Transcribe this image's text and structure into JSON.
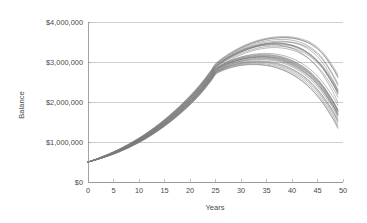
{
  "chart_data": {
    "type": "line",
    "title": "",
    "xlabel": "Years",
    "ylabel": "Balance",
    "xlim": [
      0,
      50
    ],
    "ylim": [
      0,
      4000000
    ],
    "grid": true,
    "legend": "none",
    "x_ticks": [
      0,
      5,
      10,
      15,
      20,
      25,
      30,
      35,
      40,
      45,
      50
    ],
    "x_tick_labels": [
      "0",
      "5",
      "10",
      "15",
      "20",
      "25",
      "30",
      "35",
      "40",
      "45",
      "50"
    ],
    "y_ticks": [
      0,
      1000000,
      2000000,
      3000000,
      4000000
    ],
    "y_tick_labels": [
      "$0",
      "$1,000,000",
      "$2,000,000",
      "$3,000,000",
      "$4,000,000"
    ],
    "line_color": "#7b7b7b",
    "grid_color": "#b9b9b9",
    "axis_color": "#8d8d8d",
    "background_color": "#ffffff",
    "series_count": 30,
    "x": [
      0,
      2,
      4,
      6,
      8,
      10,
      12,
      14,
      16,
      18,
      20,
      22,
      24,
      25,
      26,
      28,
      30,
      32,
      34,
      36,
      38,
      40,
      42,
      44,
      46,
      48,
      49
    ],
    "series": [
      {
        "name": "trial-01",
        "values": [
          500000,
          580000,
          672000,
          778000,
          900000,
          1040000,
          1198000,
          1375000,
          1572000,
          1790000,
          2030000,
          2300000,
          2620000,
          2800000,
          2890000,
          3010000,
          3090000,
          3140000,
          3160000,
          3150000,
          3100000,
          3010000,
          2870000,
          2670000,
          2390000,
          2010000,
          1780000
        ]
      },
      {
        "name": "trial-02",
        "values": [
          500000,
          578000,
          668000,
          772000,
          892000,
          1030000,
          1186000,
          1362000,
          1558000,
          1776000,
          2016000,
          2288000,
          2610000,
          2795000,
          2900000,
          3060000,
          3180000,
          3270000,
          3330000,
          3360000,
          3350000,
          3300000,
          3190000,
          3010000,
          2740000,
          2360000,
          2120000
        ]
      },
      {
        "name": "trial-03",
        "values": [
          500000,
          582000,
          676000,
          784000,
          908000,
          1050000,
          1210000,
          1390000,
          1590000,
          1812000,
          2056000,
          2330000,
          2650000,
          2830000,
          2920000,
          3040000,
          3120000,
          3170000,
          3190000,
          3180000,
          3130000,
          3040000,
          2900000,
          2700000,
          2420000,
          2040000,
          1810000
        ]
      },
      {
        "name": "trial-04",
        "values": [
          500000,
          576000,
          664000,
          766000,
          884000,
          1020000,
          1174000,
          1348000,
          1542000,
          1758000,
          1996000,
          2266000,
          2586000,
          2770000,
          2860000,
          2980000,
          3060000,
          3110000,
          3130000,
          3120000,
          3070000,
          2980000,
          2840000,
          2640000,
          2360000,
          1980000,
          1750000
        ]
      },
      {
        "name": "trial-05",
        "values": [
          500000,
          584000,
          680000,
          790000,
          916000,
          1060000,
          1222000,
          1404000,
          1606000,
          1830000,
          2076000,
          2352000,
          2674000,
          2855000,
          2960000,
          3120000,
          3250000,
          3350000,
          3430000,
          3480000,
          3500000,
          3490000,
          3430000,
          3300000,
          3060000,
          2660000,
          2410000
        ]
      },
      {
        "name": "trial-06",
        "values": [
          500000,
          574000,
          660000,
          760000,
          876000,
          1010000,
          1162000,
          1334000,
          1526000,
          1740000,
          1976000,
          2244000,
          2562000,
          2745000,
          2830000,
          2940000,
          3010000,
          3050000,
          3060000,
          3040000,
          2980000,
          2880000,
          2730000,
          2520000,
          2230000,
          1850000,
          1620000
        ]
      },
      {
        "name": "trial-07",
        "values": [
          500000,
          586000,
          684000,
          796000,
          924000,
          1070000,
          1234000,
          1418000,
          1622000,
          1848000,
          2096000,
          2374000,
          2698000,
          2880000,
          2985000,
          3145000,
          3270000,
          3360000,
          3410000,
          3430000,
          3410000,
          3340000,
          3210000,
          3000000,
          2690000,
          2260000,
          1990000
        ]
      },
      {
        "name": "trial-08",
        "values": [
          500000,
          572000,
          656000,
          754000,
          868000,
          1000000,
          1150000,
          1320000,
          1510000,
          1722000,
          1956000,
          2222000,
          2538000,
          2720000,
          2800000,
          2900000,
          2960000,
          2990000,
          2990000,
          2960000,
          2890000,
          2780000,
          2620000,
          2400000,
          2100000,
          1720000,
          1490000
        ]
      },
      {
        "name": "trial-09",
        "values": [
          500000,
          588000,
          688000,
          802000,
          932000,
          1080000,
          1246000,
          1432000,
          1638000,
          1866000,
          2116000,
          2396000,
          2722000,
          2905000,
          3010000,
          3170000,
          3300000,
          3400000,
          3470000,
          3510000,
          3520000,
          3490000,
          3410000,
          3250000,
          2980000,
          2560000,
          2300000
        ]
      },
      {
        "name": "trial-10",
        "values": [
          500000,
          570000,
          652000,
          748000,
          860000,
          990000,
          1138000,
          1306000,
          1494000,
          1704000,
          1936000,
          2200000,
          2514000,
          2695000,
          2775000,
          2870000,
          2925000,
          2945000,
          2935000,
          2895000,
          2815000,
          2695000,
          2525000,
          2295000,
          1990000,
          1600000,
          1370000
        ]
      },
      {
        "name": "trial-11",
        "values": [
          500000,
          590000,
          692000,
          808000,
          940000,
          1090000,
          1258000,
          1446000,
          1654000,
          1884000,
          2136000,
          2418000,
          2746000,
          2930000,
          3040000,
          3210000,
          3350000,
          3460000,
          3540000,
          3590000,
          3610000,
          3600000,
          3540000,
          3420000,
          3200000,
          2840000,
          2610000
        ]
      },
      {
        "name": "trial-12",
        "values": [
          500000,
          581000,
          674000,
          781000,
          904000,
          1045000,
          1204000,
          1382000,
          1581000,
          1801000,
          2043000,
          2315000,
          2635000,
          2815000,
          2910000,
          3035000,
          3125000,
          3185000,
          3215000,
          3210000,
          3170000,
          3090000,
          2960000,
          2770000,
          2500000,
          2140000,
          1920000
        ]
      },
      {
        "name": "trial-13",
        "values": [
          500000,
          579000,
          670000,
          775000,
          896000,
          1035000,
          1192000,
          1368000,
          1565000,
          1783000,
          2023000,
          2294000,
          2614000,
          2792000,
          2880000,
          2995000,
          3070000,
          3115000,
          3130000,
          3115000,
          3060000,
          2965000,
          2820000,
          2615000,
          2330000,
          1945000,
          1710000
        ]
      },
      {
        "name": "trial-14",
        "values": [
          500000,
          583000,
          678000,
          787000,
          912000,
          1055000,
          1216000,
          1397000,
          1598000,
          1821000,
          2066000,
          2341000,
          2662000,
          2842000,
          2945000,
          3095000,
          3215000,
          3305000,
          3365000,
          3395000,
          3390000,
          3350000,
          3255000,
          3090000,
          2840000,
          2470000,
          2240000
        ]
      },
      {
        "name": "trial-15",
        "values": [
          500000,
          577000,
          666000,
          769000,
          888000,
          1025000,
          1180000,
          1355000,
          1550000,
          1767000,
          2006000,
          2277000,
          2598000,
          2778000,
          2870000,
          2990000,
          3070000,
          3120000,
          3140000,
          3130000,
          3085000,
          2995000,
          2855000,
          2655000,
          2375000,
          1995000,
          1765000
        ]
      },
      {
        "name": "trial-16",
        "values": [
          500000,
          585000,
          682000,
          793000,
          920000,
          1065000,
          1228000,
          1411000,
          1614000,
          1839000,
          2086000,
          2363000,
          2686000,
          2868000,
          2972000,
          3132000,
          3258000,
          3355000,
          3420000,
          3455000,
          3455000,
          3415000,
          3320000,
          3155000,
          2900000,
          2520000,
          2290000
        ]
      },
      {
        "name": "trial-17",
        "values": [
          500000,
          575000,
          662000,
          763000,
          880000,
          1015000,
          1168000,
          1341000,
          1534000,
          1749000,
          1986000,
          2255000,
          2574000,
          2757000,
          2845000,
          2960000,
          3035000,
          3080000,
          3095000,
          3080000,
          3025000,
          2930000,
          2785000,
          2580000,
          2295000,
          1915000,
          1685000
        ]
      },
      {
        "name": "trial-18",
        "values": [
          500000,
          587000,
          686000,
          799000,
          928000,
          1075000,
          1240000,
          1425000,
          1630000,
          1857000,
          2106000,
          2385000,
          2710000,
          2892000,
          2998000,
          3158000,
          3285000,
          3380000,
          3445000,
          3475000,
          3470000,
          3425000,
          3320000,
          3140000,
          2865000,
          2460000,
          2215000
        ]
      },
      {
        "name": "trial-19",
        "values": [
          500000,
          573000,
          658000,
          757000,
          872000,
          1005000,
          1156000,
          1327000,
          1518000,
          1731000,
          1966000,
          2233000,
          2550000,
          2732000,
          2815000,
          2920000,
          2985000,
          3020000,
          3025000,
          3000000,
          2935000,
          2830000,
          2675000,
          2455000,
          2160000,
          1785000,
          1555000
        ]
      },
      {
        "name": "trial-20",
        "values": [
          500000,
          589000,
          690000,
          805000,
          936000,
          1085000,
          1252000,
          1439000,
          1646000,
          1875000,
          2126000,
          2407000,
          2734000,
          2918000,
          3025000,
          3190000,
          3325000,
          3430000,
          3505000,
          3550000,
          3565000,
          3545000,
          3475000,
          3335000,
          3090000,
          2700000,
          2455000
        ]
      },
      {
        "name": "trial-21",
        "values": [
          500000,
          571000,
          654000,
          751000,
          864000,
          995000,
          1144000,
          1313000,
          1502000,
          1713000,
          1946000,
          2211000,
          2526000,
          2708000,
          2788000,
          2885000,
          2942000,
          2968000,
          2962000,
          2928000,
          2852000,
          2738000,
          2572000,
          2348000,
          2045000,
          1660000,
          1430000
        ]
      },
      {
        "name": "trial-22",
        "values": [
          500000,
          592000,
          696000,
          814000,
          948000,
          1100000,
          1270000,
          1460000,
          1670000,
          1902000,
          2156000,
          2440000,
          2770000,
          2955000,
          3065000,
          3235000,
          3375000,
          3485000,
          3565000,
          3615000,
          3635000,
          3625000,
          3570000,
          3460000,
          3250000,
          2900000,
          2680000
        ]
      },
      {
        "name": "trial-23",
        "values": [
          500000,
          580000,
          673000,
          779000,
          902000,
          1042000,
          1200000,
          1378000,
          1576000,
          1795000,
          2036000,
          2307000,
          2626000,
          2806000,
          2898000,
          3018000,
          3100000,
          3150000,
          3172000,
          3165000,
          3118000,
          3030000,
          2893000,
          2693000,
          2415000,
          2030000,
          1800000
        ]
      },
      {
        "name": "trial-24",
        "values": [
          500000,
          578000,
          669000,
          773000,
          894000,
          1032000,
          1188000,
          1364000,
          1560000,
          1778000,
          2018000,
          2290000,
          2608000,
          2788000,
          2876000,
          2988000,
          3062000,
          3106000,
          3118000,
          3100000,
          3042000,
          2945000,
          2798000,
          2592000,
          2305000,
          1920000,
          1690000
        ]
      },
      {
        "name": "trial-25",
        "values": [
          500000,
          584000,
          681000,
          791000,
          918000,
          1062000,
          1224000,
          1407000,
          1610000,
          1834000,
          2081000,
          2357000,
          2680000,
          2862000,
          2966000,
          3124000,
          3248000,
          3342000,
          3404000,
          3436000,
          3432000,
          3392000,
          3296000,
          3130000,
          2874000,
          2496000,
          2264000
        ]
      },
      {
        "name": "trial-26",
        "values": [
          500000,
          574000,
          661000,
          761000,
          878000,
          1012000,
          1164000,
          1336000,
          1528000,
          1742000,
          1978000,
          2246000,
          2564000,
          2747000,
          2834000,
          2948000,
          3022000,
          3066000,
          3080000,
          3064000,
          3008000,
          2912000,
          2766000,
          2560000,
          2274000,
          1892000,
          1660000
        ]
      },
      {
        "name": "trial-27",
        "values": [
          500000,
          586000,
          685000,
          797000,
          926000,
          1072000,
          1237000,
          1422000,
          1627000,
          1853000,
          2102000,
          2380000,
          2705000,
          2887000,
          2993000,
          3152000,
          3278000,
          3372000,
          3436000,
          3466000,
          3460000,
          3414000,
          3308000,
          3126000,
          2850000,
          2442000,
          2196000
        ]
      },
      {
        "name": "trial-28",
        "values": [
          500000,
          572000,
          657000,
          755000,
          870000,
          1002000,
          1152000,
          1322000,
          1512000,
          1725000,
          1959000,
          2226000,
          2542000,
          2724000,
          2806000,
          2910000,
          2973000,
          3006000,
          3010000,
          2984000,
          2918000,
          2812000,
          2656000,
          2436000,
          2140000,
          1764000,
          1534000
        ]
      },
      {
        "name": "trial-29",
        "values": [
          500000,
          591000,
          694000,
          811000,
          944000,
          1095000,
          1264000,
          1453000,
          1662000,
          1893000,
          2146000,
          2429000,
          2758000,
          2942000,
          3050000,
          3218000,
          3356000,
          3464000,
          3542000,
          3590000,
          3608000,
          3596000,
          3538000,
          3424000,
          3208000,
          2850000,
          2624000
        ]
      },
      {
        "name": "trial-30",
        "values": [
          500000,
          569000,
          650000,
          745000,
          856000,
          985000,
          1132000,
          1299000,
          1486000,
          1695000,
          1926000,
          2189000,
          2502000,
          2684000,
          2762000,
          2857000,
          2912000,
          2934000,
          2926000,
          2888000,
          2808000,
          2690000,
          2520000,
          2290000,
          1980000,
          1580000,
          1340000
        ]
      }
    ]
  }
}
